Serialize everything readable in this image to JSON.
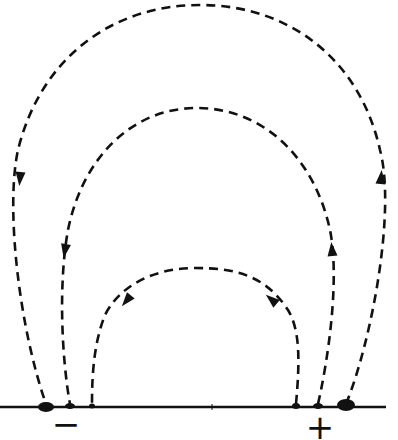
{
  "diagram": {
    "type": "field-lines",
    "colors": {
      "ink": "#111111",
      "background": "#ffffff"
    },
    "baseline": {
      "x1": 0,
      "x2": 386,
      "y": 407
    },
    "electrodes": [
      {
        "id": "negative",
        "label": "−",
        "label_x": 66,
        "label_y": 424
      },
      {
        "id": "positive",
        "label": "+",
        "label_x": 320,
        "label_y": 427
      }
    ],
    "field_lines": [
      {
        "id": "outer",
        "path": "M 346 404 C 372 340, 396 210, 380 150 C 360 60, 290 5, 200 5 C 110 5, 40 60, 18 150 C 5 210, 20 330, 46 404",
        "arrows": [
          {
            "x": 20,
            "y": 178,
            "angle": 95
          },
          {
            "x": 381,
            "y": 178,
            "angle": -85
          }
        ]
      },
      {
        "id": "middle",
        "path": "M 318 404 C 328 360, 340 280, 330 230 C 315 160, 265 108, 197 108 C 130 108, 82 160, 68 230 C 58 285, 62 360, 70 404",
        "arrows": [
          {
            "x": 65,
            "y": 250,
            "angle": 100
          },
          {
            "x": 332,
            "y": 250,
            "angle": -95
          }
        ]
      },
      {
        "id": "inner",
        "path": "M 296 404 C 300 360, 300 330, 288 310 C 265 275, 235 268, 195 268 C 155 268, 120 285, 105 315 C 93 345, 92 380, 92 404",
        "arrows": [
          {
            "x": 127,
            "y": 300,
            "angle": 130
          },
          {
            "x": 272,
            "y": 300,
            "angle": -140
          }
        ]
      }
    ],
    "contact_blobs": [
      {
        "x": 46,
        "y": 407,
        "rx": 8,
        "ry": 5
      },
      {
        "x": 70,
        "y": 406,
        "rx": 5,
        "ry": 3
      },
      {
        "x": 92,
        "y": 406,
        "rx": 3,
        "ry": 2.5
      },
      {
        "x": 296,
        "y": 406,
        "rx": 4,
        "ry": 3
      },
      {
        "x": 318,
        "y": 406,
        "rx": 5,
        "ry": 3
      },
      {
        "x": 346,
        "y": 405,
        "rx": 9,
        "ry": 6
      }
    ],
    "tick_mark": {
      "x": 212,
      "y": 407
    }
  }
}
